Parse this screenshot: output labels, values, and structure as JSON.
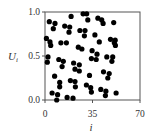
{
  "chart_data": {
    "type": "scatter",
    "title": "",
    "xlabel": "i",
    "ylabel": "U_i",
    "xlim": [
      0,
      70
    ],
    "ylim": [
      0.0,
      1.0
    ],
    "xticks": [
      "0",
      "35",
      "70"
    ],
    "yticks": [
      "0.0",
      "0.5",
      "1.0"
    ],
    "grid": false,
    "legend": null,
    "marker_color": "#000000",
    "points": [
      [
        1.0,
        0.7
      ],
      [
        1.7,
        0.43
      ],
      [
        2.2,
        0.49
      ],
      [
        3.7,
        0.66
      ],
      [
        3.2,
        0.89
      ],
      [
        4.2,
        0.62
      ],
      [
        5.2,
        0.08
      ],
      [
        7.1,
        0.27
      ],
      [
        8.6,
        0.0
      ],
      [
        9.3,
        0.06
      ],
      [
        6.1,
        0.81
      ],
      [
        7.4,
        0.87
      ],
      [
        10.2,
        0.46
      ],
      [
        10.8,
        0.15
      ],
      [
        10.8,
        0.2
      ],
      [
        11.7,
        0.65
      ],
      [
        12.6,
        0.38
      ],
      [
        13.5,
        0.44
      ],
      [
        14.5,
        0.84
      ],
      [
        15.8,
        0.65
      ],
      [
        16.3,
        0.03
      ],
      [
        17.7,
        0.77
      ],
      [
        18.2,
        0.83
      ],
      [
        19.2,
        0.95
      ],
      [
        18.7,
        0.22
      ],
      [
        21.1,
        0.42
      ],
      [
        22.1,
        0.35
      ],
      [
        22.4,
        0.15
      ],
      [
        22.1,
        0.21
      ],
      [
        20.6,
        0.02
      ],
      [
        24.5,
        0.6
      ],
      [
        25.3,
        0.33
      ],
      [
        25.3,
        0.4
      ],
      [
        25.7,
        0.79
      ],
      [
        27.2,
        0.58
      ],
      [
        28.1,
        0.98
      ],
      [
        29.0,
        0.73
      ],
      [
        29.5,
        0.79
      ],
      [
        30.5,
        0.17
      ],
      [
        30.7,
        0.98
      ],
      [
        31.5,
        0.91
      ],
      [
        32.8,
        0.28
      ],
      [
        33.7,
        0.14
      ],
      [
        34.2,
        0.09
      ],
      [
        34.2,
        0.47
      ],
      [
        34.7,
        0.56
      ],
      [
        36.8,
        0.74
      ],
      [
        37.7,
        0.46
      ],
      [
        38.3,
        0.52
      ],
      [
        39.0,
        0.93
      ],
      [
        40.0,
        0.66
      ],
      [
        41.1,
        0.12
      ],
      [
        41.8,
        0.91
      ],
      [
        42.8,
        0.87
      ],
      [
        43.1,
        0.32
      ],
      [
        44.5,
        0.05
      ],
      [
        44.9,
        0.1
      ],
      [
        45.5,
        0.49
      ],
      [
        46.3,
        0.25
      ],
      [
        47.3,
        0.3
      ],
      [
        48.3,
        0.69
      ],
      [
        49.3,
        0.44
      ],
      [
        49.9,
        0.49
      ],
      [
        50.6,
        0.88
      ],
      [
        51.1,
        0.65
      ],
      [
        51.7,
        0.68
      ],
      [
        51.9,
        0.62
      ],
      [
        52.4,
        0.08
      ]
    ]
  }
}
